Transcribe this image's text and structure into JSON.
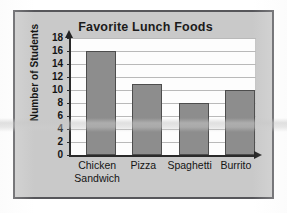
{
  "chart_data": {
    "type": "bar",
    "title": "Favorite Lunch Foods",
    "xlabel": "",
    "ylabel": "Number of Students",
    "categories": [
      "Chicken Sandwich",
      "Pizza",
      "Spaghetti",
      "Burrito"
    ],
    "category_lines": [
      [
        "Chicken",
        "Sandwich"
      ],
      [
        "Pizza"
      ],
      [
        "Spaghetti"
      ],
      [
        "Burrito"
      ]
    ],
    "values": [
      16,
      11,
      8,
      10
    ],
    "ylim": [
      0,
      18
    ],
    "ytick_step": 2,
    "yticks": [
      "0",
      "2",
      "4",
      "6",
      "8",
      "10",
      "12",
      "14",
      "16",
      "18"
    ],
    "grid": true,
    "legend": false,
    "axis_arrows": true,
    "colors": {
      "bar_fill": "#8d8d8d",
      "bar_stroke": "#4d4d4d",
      "plot_background": "#fdfdfd",
      "figure_background": "#c9c9c9",
      "figure_border": "#56565a",
      "gridline": "#b9b9b9",
      "axis": "#2a2a2a",
      "text": "#141414"
    }
  }
}
